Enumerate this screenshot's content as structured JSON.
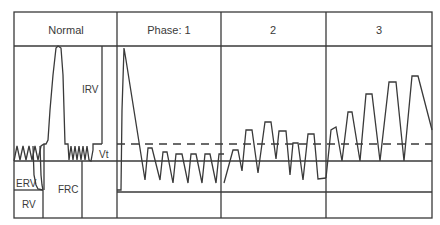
{
  "header": {
    "columns": [
      "Normal",
      "Phase: 1",
      "2",
      "3"
    ]
  },
  "labels": {
    "irv": "IRV",
    "vt": "Vt",
    "erv": "ERV",
    "rv": "RV",
    "frc": "FRC"
  },
  "colors": {
    "line": "#3a3a3a",
    "background": "#ffffff"
  }
}
